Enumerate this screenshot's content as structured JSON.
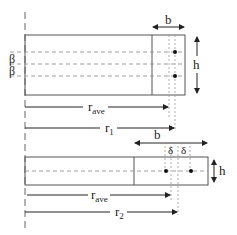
{
  "diagram": {
    "top_panel": {
      "width_label": "b",
      "height_label": "h",
      "offset_labels": [
        "β",
        "β"
      ],
      "r_ave_label": {
        "main": "r",
        "sub": "ave"
      },
      "r1_label": {
        "main": "r",
        "sub": "1"
      }
    },
    "bottom_panel": {
      "width_label": "b",
      "height_label": "h",
      "offset_labels": [
        "δ",
        "δ"
      ],
      "r_ave_label": {
        "main": "r",
        "sub": "ave"
      },
      "r2_label": {
        "main": "r",
        "sub": "2"
      }
    },
    "colors": {
      "line": "#555555",
      "dashed": "#888888",
      "dot": "#111111",
      "text": "#222222"
    }
  }
}
